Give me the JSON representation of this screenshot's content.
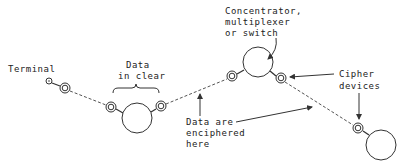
{
  "labels": {
    "terminal": "Terminal",
    "data_in_clear": [
      "Data",
      "in clear"
    ],
    "concentrator": [
      "Concentrator,",
      "multiplexer",
      "or switch"
    ],
    "cipher_devices": [
      "Cipher",
      "devices"
    ],
    "data_enciphered": [
      "Data are",
      "enciphered",
      "here"
    ]
  },
  "colors": {
    "line": "#333333",
    "background": "#ffffff"
  }
}
